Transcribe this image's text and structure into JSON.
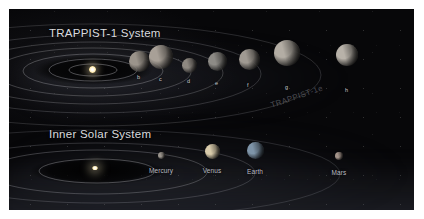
{
  "figure": {
    "background_color": "#ffffff",
    "panel_color": "#0b0b0e",
    "panel_border_color": "#2a2a2e"
  },
  "sections": {
    "trappist": {
      "title": "TRAPPIST-1 System",
      "star_name": "TRAPPIST-1",
      "star_color": "#fff3cf",
      "planets": [
        {
          "label": "b",
          "name": "TRAPPIST-1b",
          "color": "#9b948b",
          "x": 130,
          "y": 52,
          "size": 21,
          "orbit_label_x": 128,
          "orbit_label_y": 65
        },
        {
          "label": "c",
          "name": "TRAPPIST-1c",
          "color": "#a8a097",
          "x": 152,
          "y": 48,
          "size": 24,
          "orbit_label_x": 150,
          "orbit_label_y": 67
        },
        {
          "label": "d",
          "name": "TRAPPIST-1d",
          "color": "#8e8881",
          "x": 180,
          "y": 56,
          "size": 15,
          "orbit_label_x": 178,
          "orbit_label_y": 69
        },
        {
          "label": "e",
          "name": "TRAPPIST-1e",
          "color": "#8d8b86",
          "x": 208,
          "y": 52,
          "size": 19,
          "orbit_label_x": 206,
          "orbit_label_y": 71
        },
        {
          "label": "f",
          "name": "TRAPPIST-1f",
          "color": "#a09a92",
          "x": 240,
          "y": 50,
          "size": 21,
          "orbit_label_x": 238,
          "orbit_label_y": 73
        },
        {
          "label": "g",
          "name": "TRAPPIST-1g",
          "color": "#b3ada4",
          "x": 278,
          "y": 44,
          "size": 26,
          "orbit_label_x": 276,
          "orbit_label_y": 75
        },
        {
          "label": "h",
          "name": "TRAPPIST-1h",
          "color": "#b8b2a9",
          "x": 338,
          "y": 46,
          "size": 22,
          "orbit_label_x": 336,
          "orbit_label_y": 78
        }
      ],
      "orbit_count": 7
    },
    "solar": {
      "title": "Inner Solar System",
      "star_name": "Sun",
      "star_color": "#fff4d2",
      "planets": [
        {
          "label": "Mercury",
          "color": "#9a948c",
          "x": 152,
          "y": 146,
          "size": 7,
          "label_x": 152,
          "label_y": 158
        },
        {
          "label": "Venus",
          "color": "#d8cbab",
          "x": 203,
          "y": 142,
          "size": 15,
          "label_x": 203,
          "label_y": 158
        },
        {
          "label": "Earth",
          "color": "#7e94a8",
          "x": 246,
          "y": 141,
          "size": 17,
          "label_x": 246,
          "label_y": 159
        },
        {
          "label": "Mars",
          "color": "#a3938a",
          "x": 330,
          "y": 147,
          "size": 8,
          "label_x": 330,
          "label_y": 160
        }
      ],
      "orbit_count": 4
    }
  },
  "watermark": {
    "text": "TRAPPIST-1e"
  }
}
